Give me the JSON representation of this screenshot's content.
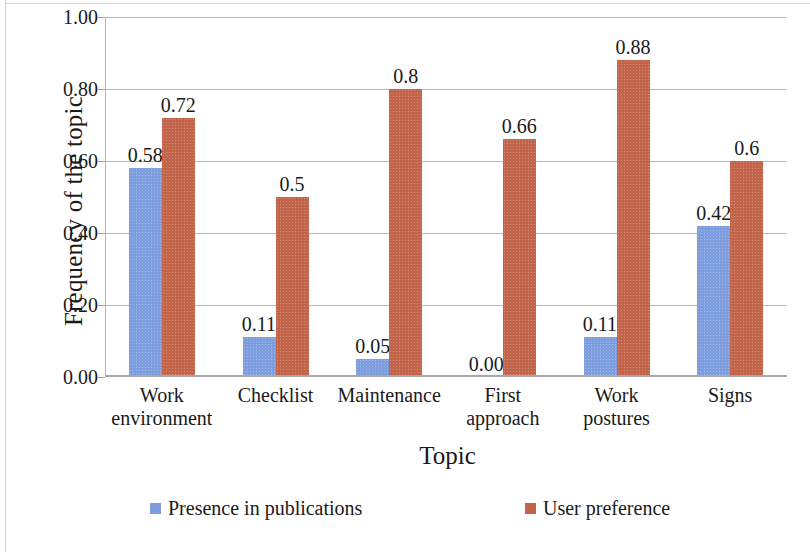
{
  "chart_data": {
    "type": "bar",
    "title": "",
    "xlabel": "Topic",
    "ylabel": "Frequency of the topic",
    "categories": [
      "Work environment",
      "Checklist",
      "Maintenance",
      "First approach",
      "Work postures",
      "Signs"
    ],
    "category_lines": [
      [
        "Work",
        "environment"
      ],
      [
        "Checklist"
      ],
      [
        "Maintenance"
      ],
      [
        "First",
        "approach"
      ],
      [
        "Work",
        "postures"
      ],
      [
        "Signs"
      ]
    ],
    "series": [
      {
        "name": "Presence in publications",
        "color": "#7e9ddf",
        "values": [
          0.58,
          0.11,
          0.05,
          0.0,
          0.11,
          0.42
        ],
        "labels": [
          "0.58",
          "0.11",
          "0.05",
          "0.00",
          "0.11",
          "0.42"
        ]
      },
      {
        "name": "User preference",
        "color": "#c26449",
        "values": [
          0.72,
          0.5,
          0.8,
          0.66,
          0.88,
          0.6
        ],
        "labels": [
          "0.72",
          "0.5",
          "0.8",
          "0.66",
          "0.88",
          "0.6"
        ]
      }
    ],
    "ylim": [
      0.0,
      1.0
    ],
    "yticks": [
      0.0,
      0.2,
      0.4,
      0.6,
      0.8,
      1.0
    ],
    "ytick_labels": [
      "0.00",
      "0.20",
      "0.40",
      "0.60",
      "0.80",
      "1.00"
    ],
    "grid": true,
    "legend_position": "bottom"
  },
  "legend": {
    "items": [
      {
        "label": "Presence in publications",
        "color": "#7e9ddf"
      },
      {
        "label": "User preference",
        "color": "#c26449"
      }
    ]
  }
}
